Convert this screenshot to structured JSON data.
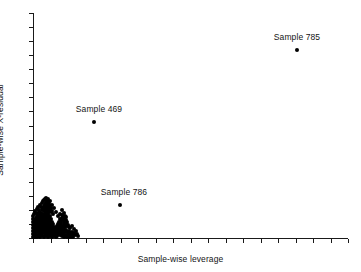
{
  "chart_data": {
    "type": "scatter",
    "title": "",
    "xlabel": "Sample-wise leverage",
    "ylabel": "Sample-wise X-residual",
    "grid": false,
    "legend": null,
    "xlim": [
      0,
      1
    ],
    "ylim": [
      0,
      1
    ],
    "x_tick_labels": [],
    "y_tick_labels": [],
    "x_tick_count": 19,
    "y_tick_count": 17,
    "annotations": [
      {
        "label": "Sample 785",
        "x": 0.838,
        "y": 0.836
      },
      {
        "label": "Sample 469",
        "x": 0.194,
        "y": 0.519
      },
      {
        "label": "Sample 786",
        "x": 0.276,
        "y": 0.147
      }
    ],
    "labeled_points": [
      {
        "name": "Sample 785",
        "px": 297,
        "py": 50
      },
      {
        "name": "Sample 469",
        "px": 94,
        "py": 122
      },
      {
        "name": "Sample 786",
        "px": 120,
        "py": 205
      }
    ],
    "label_positions": [
      {
        "name": "Sample 785",
        "px": 297,
        "py": 32
      },
      {
        "name": "Sample 469",
        "px": 99,
        "py": 104
      },
      {
        "name": "Sample 786",
        "px": 124,
        "py": 187
      }
    ],
    "cluster_description": "Dense black cluster of sample points near the origin, low leverage and low X-residual",
    "cluster_points": [
      [
        34,
        236
      ],
      [
        35,
        237
      ],
      [
        36,
        235
      ],
      [
        37,
        237
      ],
      [
        38,
        236
      ],
      [
        39,
        234
      ],
      [
        40,
        237
      ],
      [
        41,
        235
      ],
      [
        42,
        236
      ],
      [
        43,
        233
      ],
      [
        44,
        237
      ],
      [
        45,
        235
      ],
      [
        46,
        236
      ],
      [
        47,
        234
      ],
      [
        48,
        237
      ],
      [
        49,
        235
      ],
      [
        50,
        236
      ],
      [
        51,
        233
      ],
      [
        52,
        237
      ],
      [
        53,
        235
      ],
      [
        54,
        236
      ],
      [
        55,
        234
      ],
      [
        56,
        237
      ],
      [
        57,
        236
      ],
      [
        34,
        232
      ],
      [
        35,
        230
      ],
      [
        36,
        233
      ],
      [
        37,
        231
      ],
      [
        38,
        229
      ],
      [
        39,
        232
      ],
      [
        40,
        230
      ],
      [
        41,
        233
      ],
      [
        42,
        231
      ],
      [
        43,
        229
      ],
      [
        44,
        232
      ],
      [
        45,
        230
      ],
      [
        46,
        233
      ],
      [
        47,
        231
      ],
      [
        48,
        229
      ],
      [
        49,
        232
      ],
      [
        50,
        230
      ],
      [
        51,
        233
      ],
      [
        52,
        231
      ],
      [
        53,
        234
      ],
      [
        54,
        232
      ],
      [
        55,
        230
      ],
      [
        56,
        233
      ],
      [
        57,
        231
      ],
      [
        34,
        227
      ],
      [
        35,
        225
      ],
      [
        36,
        228
      ],
      [
        37,
        226
      ],
      [
        38,
        224
      ],
      [
        39,
        227
      ],
      [
        40,
        225
      ],
      [
        41,
        228
      ],
      [
        42,
        226
      ],
      [
        43,
        224
      ],
      [
        44,
        227
      ],
      [
        45,
        225
      ],
      [
        46,
        228
      ],
      [
        47,
        226
      ],
      [
        48,
        229
      ],
      [
        49,
        227
      ],
      [
        50,
        225
      ],
      [
        51,
        228
      ],
      [
        52,
        226
      ],
      [
        53,
        229
      ],
      [
        54,
        227
      ],
      [
        55,
        231
      ],
      [
        56,
        228
      ],
      [
        57,
        226
      ],
      [
        34,
        222
      ],
      [
        35,
        220
      ],
      [
        36,
        223
      ],
      [
        37,
        221
      ],
      [
        38,
        219
      ],
      [
        39,
        222
      ],
      [
        40,
        220
      ],
      [
        41,
        223
      ],
      [
        42,
        221
      ],
      [
        43,
        224
      ],
      [
        44,
        222
      ],
      [
        45,
        220
      ],
      [
        46,
        223
      ],
      [
        47,
        226
      ],
      [
        48,
        224
      ],
      [
        49,
        222
      ],
      [
        36,
        218
      ],
      [
        37,
        216
      ],
      [
        38,
        219
      ],
      [
        39,
        217
      ],
      [
        40,
        215
      ],
      [
        41,
        218
      ],
      [
        42,
        216
      ],
      [
        43,
        219
      ],
      [
        44,
        217
      ],
      [
        45,
        220
      ],
      [
        46,
        218
      ],
      [
        47,
        221
      ],
      [
        48,
        219
      ],
      [
        49,
        223
      ],
      [
        50,
        221
      ],
      [
        51,
        224
      ],
      [
        38,
        214
      ],
      [
        39,
        212
      ],
      [
        40,
        215
      ],
      [
        41,
        213
      ],
      [
        42,
        216
      ],
      [
        43,
        214
      ],
      [
        44,
        217
      ],
      [
        45,
        215
      ],
      [
        46,
        213
      ],
      [
        47,
        216
      ],
      [
        48,
        214
      ],
      [
        49,
        218
      ],
      [
        50,
        216
      ],
      [
        51,
        219
      ],
      [
        52,
        222
      ],
      [
        53,
        224
      ],
      [
        42,
        210
      ],
      [
        43,
        208
      ],
      [
        44,
        211
      ],
      [
        45,
        209
      ],
      [
        46,
        212
      ],
      [
        47,
        210
      ],
      [
        48,
        213
      ],
      [
        49,
        211
      ],
      [
        44,
        206
      ],
      [
        45,
        204
      ],
      [
        46,
        207
      ],
      [
        47,
        205
      ],
      [
        48,
        208
      ],
      [
        49,
        206
      ],
      [
        50,
        209
      ],
      [
        51,
        212
      ],
      [
        46,
        203
      ],
      [
        47,
        201
      ],
      [
        48,
        204
      ],
      [
        49,
        202
      ],
      [
        50,
        205
      ],
      [
        51,
        208
      ],
      [
        52,
        211
      ],
      [
        53,
        214
      ],
      [
        58,
        234
      ],
      [
        59,
        232
      ],
      [
        60,
        235
      ],
      [
        61,
        233
      ],
      [
        62,
        236
      ],
      [
        63,
        234
      ],
      [
        64,
        237
      ],
      [
        65,
        235
      ],
      [
        58,
        229
      ],
      [
        59,
        227
      ],
      [
        60,
        230
      ],
      [
        61,
        228
      ],
      [
        62,
        231
      ],
      [
        63,
        233
      ],
      [
        64,
        230
      ],
      [
        65,
        232
      ],
      [
        58,
        224
      ],
      [
        59,
        222
      ],
      [
        60,
        225
      ],
      [
        61,
        223
      ],
      [
        62,
        226
      ],
      [
        63,
        228
      ],
      [
        64,
        225
      ],
      [
        65,
        227
      ],
      [
        60,
        219
      ],
      [
        61,
        221
      ],
      [
        62,
        218
      ],
      [
        63,
        220
      ],
      [
        64,
        223
      ],
      [
        65,
        221
      ],
      [
        66,
        224
      ],
      [
        67,
        226
      ],
      [
        62,
        215
      ],
      [
        63,
        217
      ],
      [
        64,
        219
      ],
      [
        65,
        216
      ],
      [
        66,
        220
      ],
      [
        67,
        222
      ],
      [
        68,
        225
      ],
      [
        69,
        227
      ],
      [
        66,
        230
      ],
      [
        67,
        232
      ],
      [
        68,
        234
      ],
      [
        69,
        231
      ],
      [
        70,
        233
      ],
      [
        71,
        235
      ],
      [
        72,
        232
      ],
      [
        73,
        234
      ],
      [
        66,
        236
      ],
      [
        67,
        237
      ],
      [
        68,
        236
      ],
      [
        69,
        237
      ],
      [
        70,
        236
      ],
      [
        71,
        237
      ],
      [
        72,
        236
      ],
      [
        73,
        237
      ],
      [
        74,
        233
      ],
      [
        75,
        235
      ],
      [
        76,
        231
      ],
      [
        77,
        234
      ],
      [
        78,
        236
      ],
      [
        70,
        228
      ],
      [
        72,
        226
      ],
      [
        74,
        229
      ],
      [
        33,
        237
      ],
      [
        33,
        234
      ],
      [
        33,
        231
      ],
      [
        33,
        228
      ],
      [
        33,
        225
      ],
      [
        33,
        222
      ],
      [
        33,
        219
      ],
      [
        33,
        216
      ],
      [
        34,
        214
      ],
      [
        35,
        211
      ],
      [
        36,
        213
      ],
      [
        37,
        209
      ],
      [
        38,
        207
      ],
      [
        39,
        210
      ],
      [
        40,
        205
      ],
      [
        41,
        207
      ],
      [
        42,
        203
      ],
      [
        43,
        201
      ],
      [
        44,
        200
      ],
      [
        45,
        199
      ],
      [
        46,
        198
      ],
      [
        47,
        200
      ],
      [
        48,
        199
      ],
      [
        50,
        201
      ],
      [
        52,
        205
      ],
      [
        54,
        208
      ],
      [
        56,
        212
      ],
      [
        58,
        216
      ],
      [
        60,
        214
      ],
      [
        62,
        210
      ],
      [
        64,
        213
      ],
      [
        66,
        217
      ]
    ]
  },
  "axis": {
    "x_label": "Sample-wise leverage",
    "y_label": "Sample-wise X-residual"
  }
}
